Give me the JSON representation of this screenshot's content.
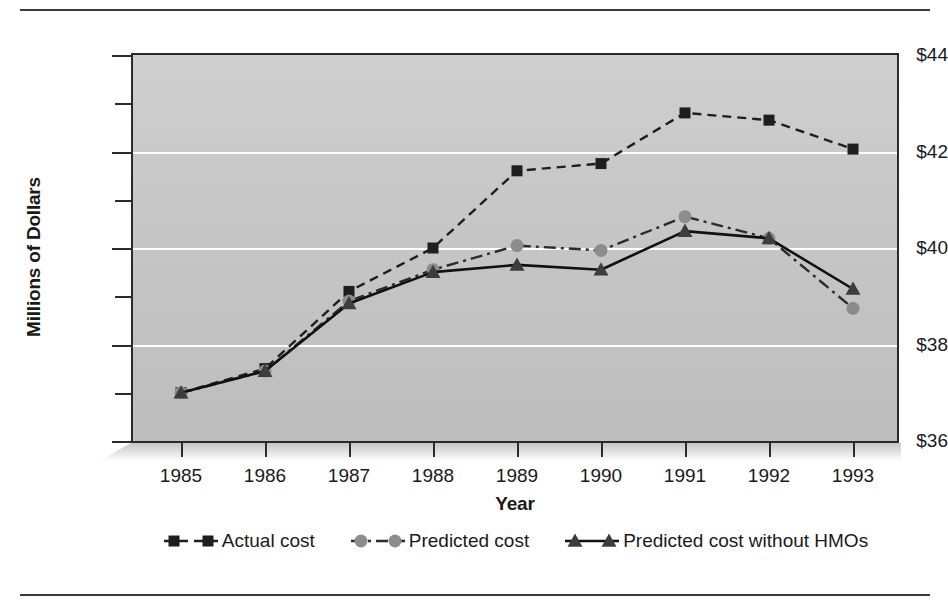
{
  "chart_data": {
    "type": "line",
    "title": "",
    "xlabel": "Year",
    "ylabel": "Millions of Dollars",
    "categories": [
      "1985",
      "1986",
      "1987",
      "1988",
      "1989",
      "1990",
      "1991",
      "1992",
      "1993"
    ],
    "x": [
      1985,
      1986,
      1987,
      1988,
      1989,
      1990,
      1991,
      1992,
      1993
    ],
    "ylim": [
      36,
      44
    ],
    "ytick_values": [
      36,
      38,
      40,
      42,
      44
    ],
    "ytick_labels": [
      "$36",
      "$38",
      "$40",
      "$42",
      "$44"
    ],
    "yminor_tick_values": [
      37,
      39,
      41,
      43
    ],
    "grid": "horizontal-major-only",
    "legend_position": "bottom-center",
    "plot_background": "#c6c6c6",
    "series": [
      {
        "name": "Actual cost",
        "values": [
          37.0,
          37.5,
          39.1,
          40.0,
          41.6,
          41.75,
          42.8,
          42.65,
          42.05
        ],
        "color": "#1e1e1e",
        "marker": "square",
        "linestyle": "dashed"
      },
      {
        "name": "Predicted cost",
        "values": [
          37.0,
          37.45,
          38.9,
          39.55,
          40.05,
          39.95,
          40.65,
          40.2,
          38.75
        ],
        "color": "#8c8c8c",
        "linecolor": "#2b2b2b",
        "marker": "circle",
        "linestyle": "dash-dot"
      },
      {
        "name": "Predicted cost without HMOs",
        "values": [
          37.0,
          37.45,
          38.85,
          39.5,
          39.65,
          39.55,
          40.35,
          40.2,
          39.15
        ],
        "color": "#3d3d3d",
        "linecolor": "#111111",
        "marker": "triangle",
        "linestyle": "solid"
      }
    ]
  },
  "legend": {
    "items": [
      {
        "label": "Actual cost",
        "swatch": "dashed-square-marker-swatch"
      },
      {
        "label": "Predicted cost",
        "swatch": "dashdot-circle-marker-swatch"
      },
      {
        "label": "Predicted cost without HMOs",
        "swatch": "solid-triangle-marker-swatch"
      }
    ]
  },
  "axes": {
    "y_title": "Millions of Dollars",
    "x_title": "Year"
  }
}
